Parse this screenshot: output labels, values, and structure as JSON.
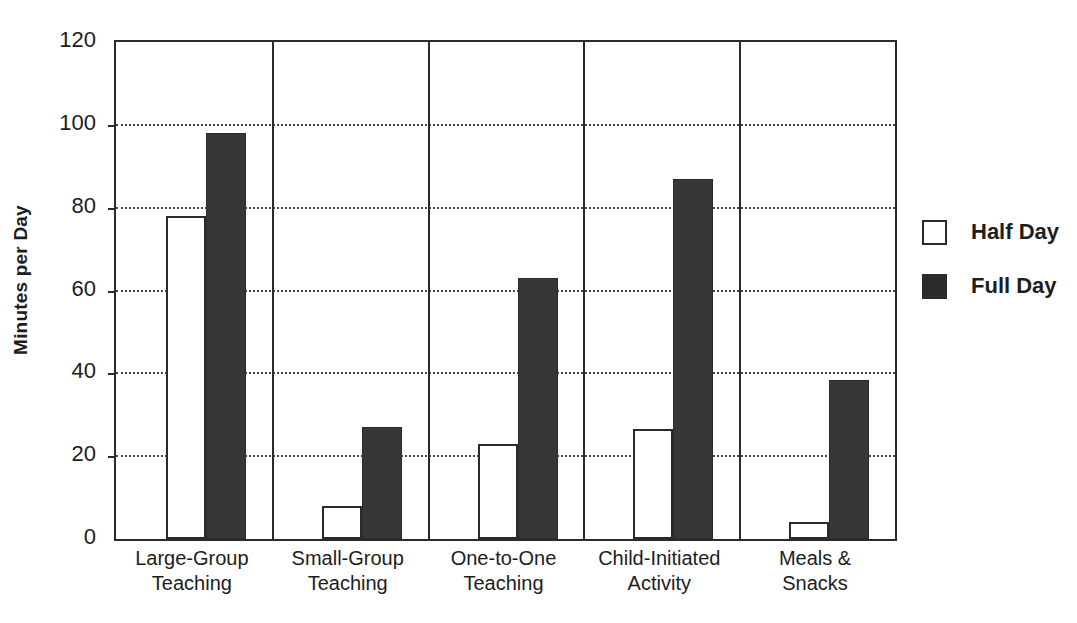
{
  "chart_data": {
    "type": "bar",
    "title": "",
    "subtitle": "",
    "xlabel": "",
    "ylabel": "Minutes per Day",
    "ylim": [
      0,
      120
    ],
    "yticks": [
      0,
      20,
      40,
      60,
      80,
      100,
      120
    ],
    "ytick_labels": [
      "0",
      "20",
      "40",
      "60",
      "80",
      "100",
      "120"
    ],
    "grid": "horizontal-dotted",
    "legend_position": "right",
    "categories": [
      "Large-Group\nTeaching",
      "Small-Group\nTeaching",
      "One-to-One\nTeaching",
      "Child-Initiated\nActivity",
      "Meals &\nSnacks"
    ],
    "category_lines": [
      [
        "Large-Group",
        "Teaching"
      ],
      [
        "Small-Group",
        "Teaching"
      ],
      [
        "One-to-One",
        "Teaching"
      ],
      [
        "Child-Initiated",
        "Activity"
      ],
      [
        "Meals &",
        "Snacks"
      ]
    ],
    "series": [
      {
        "name": "Half Day",
        "swatch": "open",
        "color": "#ffffff",
        "edge_color": "#2b2b2b",
        "values": [
          78,
          8,
          23,
          26.5,
          4
        ]
      },
      {
        "name": "Full Day",
        "swatch": "filled",
        "color": "#373737",
        "edge_color": "#2b2b2b",
        "values": [
          98,
          27,
          63,
          87,
          38.5
        ]
      }
    ]
  },
  "axis": {
    "y_title": "Minutes per Day",
    "y_tick_0": "0",
    "y_tick_1": "20",
    "y_tick_2": "40",
    "y_tick_3": "60",
    "y_tick_4": "80",
    "y_tick_5": "100",
    "y_tick_6": "120"
  },
  "legend": {
    "items": [
      {
        "label": "Half Day",
        "swatch": "open"
      },
      {
        "label": "Full Day",
        "swatch": "filled"
      }
    ]
  }
}
